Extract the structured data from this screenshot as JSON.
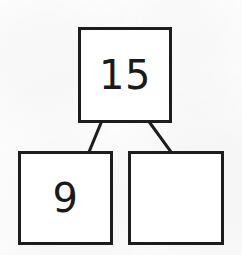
{
  "diagram": {
    "type": "number-bond",
    "ink_color": "#1d1d1d",
    "paper_color": "#fefefe",
    "whole": {
      "label": "15",
      "role": "whole",
      "filled": true
    },
    "parts": [
      {
        "label": "9",
        "role": "known-part",
        "filled": true
      },
      {
        "label": "",
        "role": "missing-part",
        "filled": false
      }
    ],
    "connectors": [
      {
        "name": "whole-to-left-part",
        "x1": 101,
        "y1": 123,
        "x2": 89,
        "y2": 152
      },
      {
        "name": "whole-to-right-part",
        "x1": 150,
        "y1": 123,
        "x2": 171,
        "y2": 152
      }
    ]
  }
}
